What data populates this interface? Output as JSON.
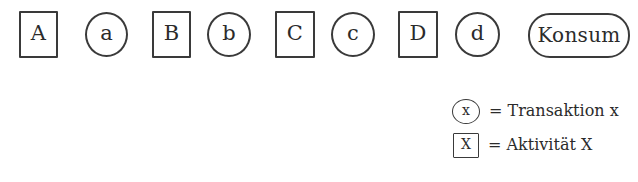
{
  "diagram": {
    "stroke_color": "#3a3a3a",
    "background_color": "#ffffff",
    "text_color": "#2b2b2b",
    "nodes": [
      {
        "label": "A",
        "shape": "square",
        "type": "activity",
        "x": 19,
        "y": 11,
        "width": 39,
        "height": 47
      },
      {
        "label": "a",
        "shape": "circle",
        "type": "transaction",
        "x": 85,
        "y": 12,
        "width": 43,
        "height": 45
      },
      {
        "label": "B",
        "shape": "square",
        "type": "activity",
        "x": 152,
        "y": 11,
        "width": 39,
        "height": 47
      },
      {
        "label": "b",
        "shape": "circle",
        "type": "transaction",
        "x": 207,
        "y": 12,
        "width": 44,
        "height": 45
      },
      {
        "label": "C",
        "shape": "square",
        "type": "activity",
        "x": 275,
        "y": 11,
        "width": 40,
        "height": 47
      },
      {
        "label": "c",
        "shape": "circle",
        "type": "transaction",
        "x": 331,
        "y": 12,
        "width": 44,
        "height": 45
      },
      {
        "label": "D",
        "shape": "square",
        "type": "activity",
        "x": 398,
        "y": 11,
        "width": 40,
        "height": 47
      },
      {
        "label": "d",
        "shape": "circle",
        "type": "transaction",
        "x": 455,
        "y": 12,
        "width": 45,
        "height": 45
      },
      {
        "label": "Konsum",
        "shape": "rounded-rect",
        "type": "terminal",
        "x": 528,
        "y": 13,
        "width": 102,
        "height": 45
      }
    ]
  },
  "legend": {
    "rows": [
      {
        "key_glyph": "x",
        "key_shape": "circle",
        "equals": "=",
        "text": "= Transaktion x"
      },
      {
        "key_glyph": "X",
        "key_shape": "square",
        "equals": "=",
        "text": "= Aktivität X"
      }
    ]
  }
}
